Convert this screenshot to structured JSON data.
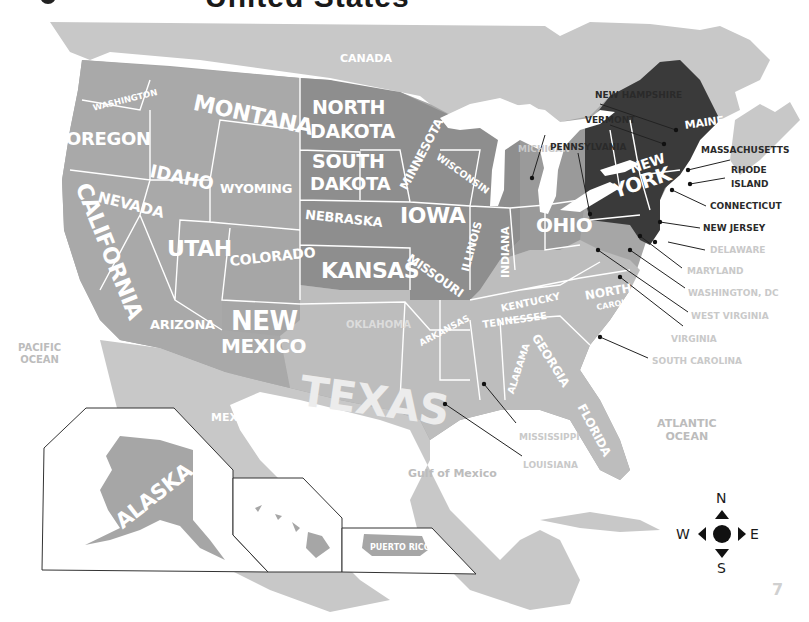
{
  "header": {
    "title": "United States"
  },
  "map": {
    "colors": {
      "background": "#ffffff",
      "neighbor_land": "#c8c8c8",
      "shade_light": "#bdbdbd",
      "shade_mid": "#a6a6a6",
      "shade_dark": "#8e8e8e",
      "shade_darkest": "#3a3a3a",
      "border": "#ffffff",
      "callout_line": "#222222"
    },
    "countries": {
      "canada": "CANADA",
      "mexico": "MEXICO"
    },
    "water": {
      "pacific": "PACIFIC\nOCEAN",
      "pacific_line1": "PACIFIC",
      "pacific_line2": "OCEAN",
      "atlantic_line1": "ATLANTIC",
      "atlantic_line2": "OCEAN",
      "gulf": "Gulf of Mexico"
    },
    "states_on_map": {
      "washington": "WASHINGTON",
      "oregon": "OREGON",
      "california": "CALIFORNIA",
      "nevada": "NEVADA",
      "idaho": "IDAHO",
      "montana": "MONTANA",
      "wyoming": "WYOMING",
      "utah": "UTAH",
      "arizona": "ARIZONA",
      "colorado": "COLORADO",
      "new_mexico_1": "NEW",
      "new_mexico_2": "MEXICO",
      "north_dakota_1": "NORTH",
      "north_dakota_2": "DAKOTA",
      "south_dakota_1": "SOUTH",
      "south_dakota_2": "DAKOTA",
      "nebraska": "NEBRASKA",
      "kansas": "KANSAS",
      "oklahoma": "OKLAHOMA",
      "texas": "TEXAS",
      "minnesota": "MINNESOTA",
      "iowa": "IOWA",
      "missouri": "MISSOURI",
      "arkansas": "ARKANSAS",
      "wisconsin": "WISCONSIN",
      "illinois": "ILLINOIS",
      "indiana": "INDIANA",
      "ohio": "OHIO",
      "kentucky": "KENTUCKY",
      "tennessee": "TENNESSEE",
      "alabama": "ALABAMA",
      "georgia": "GEORGIA",
      "florida": "FLORIDA",
      "north_carolina_1": "NORTH",
      "north_carolina_2": "CAROLINA",
      "new_york_1": "NEW",
      "new_york_2": "YORK",
      "maine": "MAINE",
      "alaska": "ALASKA",
      "hawaii": "HAWAII",
      "puerto_rico": "PUERTO RICO"
    },
    "callouts": [
      {
        "label": "MICHIGAN",
        "tone": "light"
      },
      {
        "label": "NEW HAMPSHIRE",
        "tone": "dark"
      },
      {
        "label": "VERMONT",
        "tone": "dark"
      },
      {
        "label": "PENNSYLVANIA",
        "tone": "dark"
      },
      {
        "label": "MASSACHUSETTS",
        "tone": "dark"
      },
      {
        "label": "RHODE",
        "tone": "dark"
      },
      {
        "label": "ISLAND",
        "tone": "dark"
      },
      {
        "label": "CONNECTICUT",
        "tone": "dark"
      },
      {
        "label": "NEW JERSEY",
        "tone": "dark"
      },
      {
        "label": "DELAWARE",
        "tone": "light"
      },
      {
        "label": "MARYLAND",
        "tone": "light"
      },
      {
        "label": "WASHINGTON, DC",
        "tone": "light"
      },
      {
        "label": "WEST VIRGINIA",
        "tone": "light"
      },
      {
        "label": "VIRGINIA",
        "tone": "light"
      },
      {
        "label": "SOUTH CAROLINA",
        "tone": "light"
      },
      {
        "label": "MISSISSIPPI",
        "tone": "light"
      },
      {
        "label": "LOUISIANA",
        "tone": "light"
      }
    ],
    "compass": {
      "n": "N",
      "s": "S",
      "e": "E",
      "w": "W"
    },
    "page_number": "7"
  }
}
